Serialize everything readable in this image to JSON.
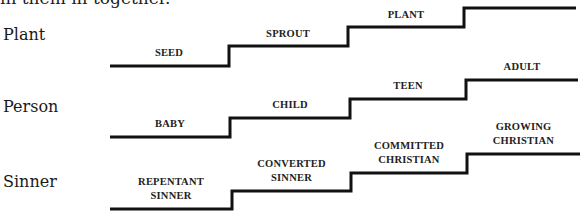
{
  "intro_text": "in them in together.",
  "rows": [
    {
      "label": "Plant",
      "stages": [
        "SEED",
        "SPROUT",
        "PLANT",
        ""
      ]
    },
    {
      "label": "Person",
      "stages": [
        "BABY",
        "CHILD",
        "TEEN",
        "ADULT"
      ]
    },
    {
      "label": "Sinner",
      "stages": [
        [
          "REPENTANT",
          "SINNER"
        ],
        [
          "CONVERTED",
          "SINNER"
        ],
        [
          "COMMITTED",
          "CHRISTIAN"
        ],
        [
          "GROWING",
          "CHRISTIAN"
        ]
      ]
    }
  ],
  "colors": {
    "line": "#111111",
    "text": "#1a1a1a"
  }
}
